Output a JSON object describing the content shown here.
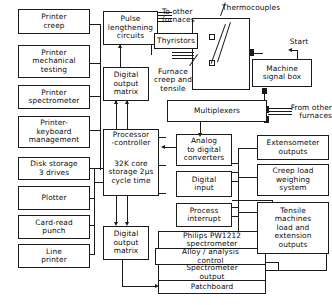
{
  "diagram": {
    "line_color": "#1a1a1a",
    "background_color": "#ffffff",
    "width": 332,
    "height": 305
  },
  "boxes": {
    "printer_creep": "Printer\ncreep",
    "printer_mechanical_testing": "Printer\nmechanical\ntesting",
    "printer_spectrometer": "Printer\nspectrometer",
    "printer_keyboard_management": "Printer-\nkeyboard\nmanagement",
    "disk_storage": "Disk storage\n3 drives",
    "plotter": "Plotter",
    "card_read_punch": "Card-read\npunch",
    "line_printer": "Line\nprinter",
    "pulse_lengthening_circuits": "Pulse\nlengthening\ncircuits",
    "digital_output_matrix_top": "Digital\noutput\nmatrix",
    "processor_controller": "Processor\n-controller",
    "core_storage": "32K core\nstorage 2µs\ncycle time",
    "digital_output_matrix_bottom": "Digital\noutput\nmatrix",
    "thyristors": "Thyristors",
    "multiplexers": "Multiplexers",
    "machine_signal_box": "Machine\nsignal box",
    "analog_to_digital_converters": "Analog\nto digital\nconverters",
    "digital_input": "Digital\ninput",
    "process_interrupt": "Process\ninterrupt",
    "philips_spectrometer": "Philips PW1212\nspectrometer",
    "alloy_analysis_control": "Alloy / analysis\ncontrol",
    "spectrometer_output": "Spectrometer\noutput",
    "patchboard": "Patchboard",
    "extensometer_outputs": "Extensometer\noutputs",
    "creep_load_weighing_system": "Creep load\nweighing\nsystem",
    "tensile_machines_outputs": "Tensile\nmachines\nload and\nextension\noutputs"
  },
  "labels": {
    "to_other_furnaces": "To other\nfurnaces",
    "thermocouples": "Thermocouples",
    "furnace_creep_and_tensile": "Furnace\ncreep and\ntensile",
    "start": "Start",
    "from_other_furnaces": "From other\nfurnaces"
  }
}
